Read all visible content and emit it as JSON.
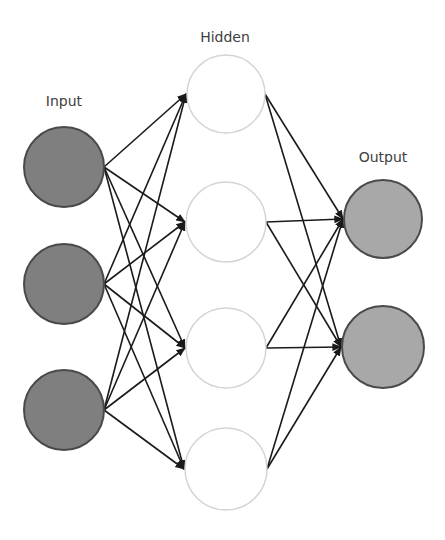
{
  "diagram": {
    "type": "neural-network",
    "colors": {
      "background": "#ffffff",
      "input_fill": "#7f7f7f",
      "input_stroke": "#4a4a4a",
      "hidden_fill": "#ffffff",
      "hidden_stroke": "#d4d4d4",
      "output_fill": "#a8a8a8",
      "output_stroke": "#4a4a4a",
      "edge": "#1a1a1a",
      "label": "#404040"
    },
    "layers": [
      {
        "name": "input",
        "label": "Input",
        "label_pos": [
          64,
          106
        ],
        "nodes": [
          {
            "id": "i1",
            "cx": 64,
            "cy": 167,
            "r": 40
          },
          {
            "id": "i2",
            "cx": 64,
            "cy": 284,
            "r": 40
          },
          {
            "id": "i3",
            "cx": 64,
            "cy": 410,
            "r": 40
          }
        ]
      },
      {
        "name": "hidden",
        "label": "Hidden",
        "label_pos": [
          225,
          42
        ],
        "nodes": [
          {
            "id": "h1",
            "cx": 226,
            "cy": 94,
            "r": 39
          },
          {
            "id": "h2",
            "cx": 226,
            "cy": 222,
            "r": 40
          },
          {
            "id": "h3",
            "cx": 226,
            "cy": 348,
            "r": 40
          },
          {
            "id": "h4",
            "cx": 226,
            "cy": 469,
            "r": 41
          }
        ]
      },
      {
        "name": "output",
        "label": "Output",
        "label_pos": [
          383,
          162
        ],
        "nodes": [
          {
            "id": "o1",
            "cx": 383,
            "cy": 219,
            "r": 39
          },
          {
            "id": "o2",
            "cx": 383,
            "cy": 347,
            "r": 41
          }
        ]
      }
    ],
    "edges": [
      {
        "from": "i1",
        "to": "h1"
      },
      {
        "from": "i1",
        "to": "h2"
      },
      {
        "from": "i1",
        "to": "h3"
      },
      {
        "from": "i1",
        "to": "h4"
      },
      {
        "from": "i2",
        "to": "h1"
      },
      {
        "from": "i2",
        "to": "h2"
      },
      {
        "from": "i2",
        "to": "h3"
      },
      {
        "from": "i2",
        "to": "h4"
      },
      {
        "from": "i3",
        "to": "h1"
      },
      {
        "from": "i3",
        "to": "h2"
      },
      {
        "from": "i3",
        "to": "h3"
      },
      {
        "from": "i3",
        "to": "h4"
      },
      {
        "from": "h1",
        "to": "o1"
      },
      {
        "from": "h1",
        "to": "o2"
      },
      {
        "from": "h2",
        "to": "o1"
      },
      {
        "from": "h2",
        "to": "o2"
      },
      {
        "from": "h3",
        "to": "o1"
      },
      {
        "from": "h3",
        "to": "o2"
      },
      {
        "from": "h4",
        "to": "o1"
      },
      {
        "from": "h4",
        "to": "o2"
      }
    ]
  }
}
